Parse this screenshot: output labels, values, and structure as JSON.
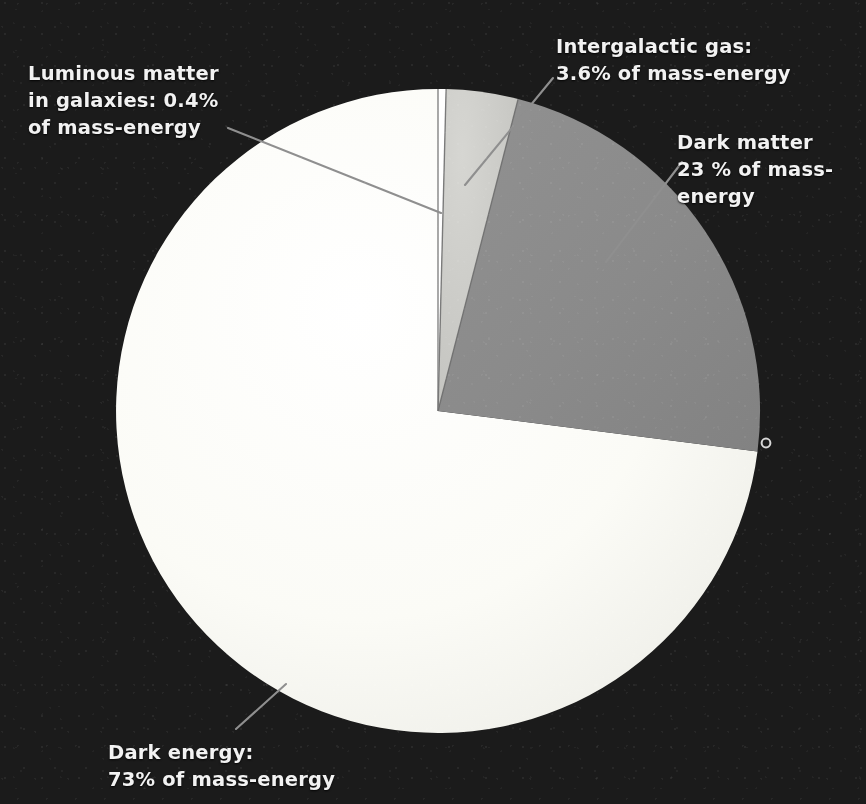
{
  "figure": {
    "background_color": "#1b1b1b",
    "text_color": "#f2f2f2",
    "leader_line_color": "#8f8f8f",
    "center": {
      "x": 438,
      "y": 411
    },
    "radius": 322,
    "marker_dot": {
      "x": 766,
      "y": 443,
      "label": "edge-marker-dot"
    }
  },
  "chart_data": {
    "type": "pie",
    "title": "",
    "xlabel": "",
    "ylabel": "",
    "units": "% of mass-energy",
    "start_angle_deg": 0,
    "direction": "clockwise",
    "legend": "none (direct labels with leader lines)",
    "categories": [
      "Luminous matter in galaxies",
      "Intergalactic gas",
      "Dark matter",
      "Dark energy"
    ],
    "values": [
      0.4,
      3.6,
      23,
      73
    ],
    "colors": [
      "#fdfdfb",
      "#c9c9c5",
      "#8a8a8a",
      "#fbfbf7"
    ],
    "slices": [
      {
        "name": "luminous-matter",
        "label_line1": "Luminous matter",
        "label_line2": "in galaxies: 0.4%",
        "label_line3": "of mass-energy",
        "label_full": "Luminous matter\nin galaxies: 0.4%\nof mass-energy",
        "value": 0.4,
        "color": "#fdfdfb",
        "start_deg": 0,
        "end_deg": 1.44
      },
      {
        "name": "intergalactic-gas",
        "label_line1": "Intergalactic gas:",
        "label_line2": "3.6% of mass-energy",
        "label_full": "Intergalactic gas:\n3.6% of mass-energy",
        "value": 3.6,
        "color": "#c9c9c5",
        "start_deg": 1.44,
        "end_deg": 14.4
      },
      {
        "name": "dark-matter",
        "label_line1": "Dark matter",
        "label_line2": "23 % of mass-",
        "label_line3": "energy",
        "label_full": "Dark matter\n23 % of mass-\nenergy",
        "value": 23,
        "color": "#8a8a8a",
        "start_deg": 14.4,
        "end_deg": 97.2
      },
      {
        "name": "dark-energy",
        "label_line1": "Dark energy:",
        "label_line2": "73% of mass-energy",
        "label_full": "Dark energy:\n73% of mass-energy",
        "value": 73,
        "color": "#fbfbf7",
        "start_deg": 97.2,
        "end_deg": 360
      }
    ]
  }
}
